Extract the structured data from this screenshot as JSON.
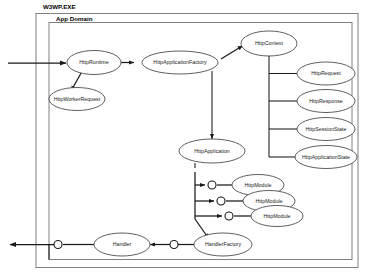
{
  "diagram": {
    "containers": [
      {
        "id": "process",
        "label": "W3WP.EXE"
      },
      {
        "id": "appdomain",
        "label": "App Domain"
      }
    ],
    "nodes": [
      {
        "id": "httpruntime",
        "label": "HttpRuntime"
      },
      {
        "id": "httpworkerrequest",
        "label": "HttpWorkerRequest"
      },
      {
        "id": "httpapplicationfactory",
        "label": "HttpApplicationFactory"
      },
      {
        "id": "httpcontext",
        "label": "HttpContext"
      },
      {
        "id": "httprequest",
        "label": "HttpRequest"
      },
      {
        "id": "httpresponse",
        "label": "HttpResponse"
      },
      {
        "id": "httpsessionstate",
        "label": "HttpSessionState"
      },
      {
        "id": "httpapplicationstate",
        "label": "HttpApplicationState"
      },
      {
        "id": "httpapplication",
        "label": "HttpApplication"
      },
      {
        "id": "httpmodule1",
        "label": "HttpModule"
      },
      {
        "id": "httpmodule2",
        "label": "HttpModule"
      },
      {
        "id": "httpmodule3",
        "label": "HttpModule"
      },
      {
        "id": "handlerfactory",
        "label": "HandlerFactory"
      },
      {
        "id": "handler",
        "label": "Handler"
      }
    ],
    "colors": {
      "node_stroke": "#4d4d4d",
      "node_fill": "#ffffff",
      "line": "#1a1a1a",
      "container_stroke": "#808080",
      "text": "#1a1a1a",
      "background": "#ffffff"
    }
  }
}
